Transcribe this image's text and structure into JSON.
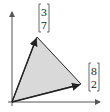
{
  "diagram": {
    "vectors": [
      {
        "name": "v1",
        "components": [
          3,
          7
        ],
        "top": "3",
        "bottom": "7"
      },
      {
        "name": "v2",
        "components": [
          8,
          2
        ],
        "top": "8",
        "bottom": "2"
      }
    ],
    "colors": {
      "fill": "#d9d9d9",
      "stroke": "#222222",
      "axis": "#555555"
    }
  }
}
